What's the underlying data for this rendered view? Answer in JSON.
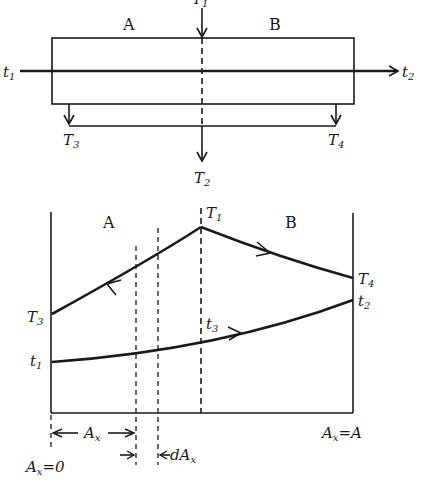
{
  "top_diagram": {
    "region_a": "A",
    "region_b": "B",
    "inlet_hot": {
      "main": "T",
      "sub": "1"
    },
    "outlet_hot_mix": {
      "main": "T",
      "sub": "2"
    },
    "outlet_hot_a": {
      "main": "T",
      "sub": "3"
    },
    "outlet_hot_b": {
      "main": "T",
      "sub": "4"
    },
    "cold_in": {
      "main": "t",
      "sub": "1"
    },
    "cold_out": {
      "main": "t",
      "sub": "2"
    }
  },
  "bottom_diagram": {
    "region_a": "A",
    "region_b": "B",
    "peak": {
      "main": "T",
      "sub": "1"
    },
    "left_hot": {
      "main": "T",
      "sub": "3"
    },
    "right_hot": {
      "main": "T",
      "sub": "4"
    },
    "left_cold": {
      "main": "t",
      "sub": "1"
    },
    "right_cold": {
      "main": "t",
      "sub": "2"
    },
    "mid_cold": {
      "main": "t",
      "sub": "3"
    },
    "ax_label": "A",
    "ax_sub": "x",
    "dax_prefix": "dA",
    "dax_sub": "x",
    "ax_zero": {
      "main": "A",
      "sub": "x",
      "eq": "=0"
    },
    "ax_full": {
      "main": "A",
      "sub": "x",
      "eq": "=A"
    }
  }
}
